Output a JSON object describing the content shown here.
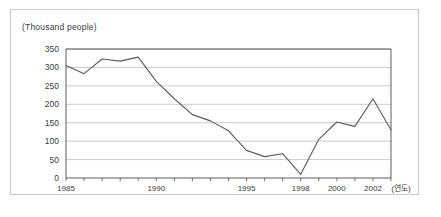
{
  "chart_data": {
    "type": "line",
    "title": "",
    "subtitle": "",
    "unit_label": "(Thousand people)",
    "xlabel": "(연도)",
    "ylabel": "",
    "ylim": [
      0,
      350
    ],
    "ytick_step": 50,
    "yticks": [
      "0",
      "50",
      "100",
      "150",
      "200",
      "250",
      "300",
      "350"
    ],
    "xlim": [
      1985,
      2003
    ],
    "xtick_step": 1,
    "xticklabels": [
      "1985",
      "1990",
      "1995",
      "1998",
      "2000",
      "2002"
    ],
    "xticklabel_years": [
      1985,
      1990,
      1995,
      1998,
      2000,
      2002
    ],
    "grid": "horizontal",
    "legend": "none",
    "line_color": "#5a5a5a",
    "x": [
      1985,
      1986,
      1987,
      1988,
      1989,
      1990,
      1991,
      1992,
      1993,
      1994,
      1995,
      1996,
      1997,
      1998,
      1999,
      2000,
      2001,
      2002,
      2003
    ],
    "values": [
      305,
      283,
      323,
      317,
      328,
      262,
      215,
      172,
      155,
      128,
      75,
      58,
      66,
      10,
      105,
      152,
      140,
      215,
      130
    ],
    "series": [
      {
        "name": "",
        "values": [
          305,
          283,
          323,
          317,
          328,
          262,
          215,
          172,
          155,
          128,
          75,
          58,
          66,
          10,
          105,
          152,
          140,
          215,
          130
        ]
      }
    ],
    "annotations": []
  },
  "colors": {
    "frame_border": "#c9c9c9",
    "axis": "#4a4a4a",
    "gridline": "#b5b5b5",
    "line": "#5a5a5a",
    "text": "#3a3a3a",
    "background": "#ffffff"
  }
}
